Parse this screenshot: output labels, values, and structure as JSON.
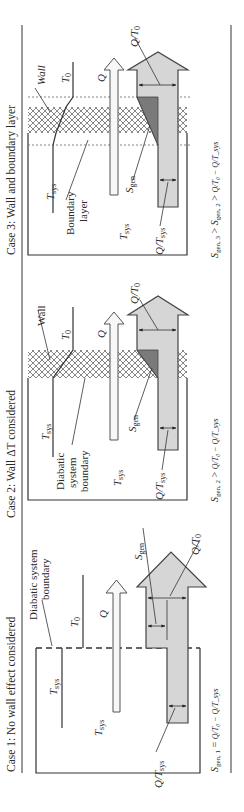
{
  "figure": {
    "orientation": "rotated-90-ccw",
    "colors": {
      "line": "#333333",
      "heat_arrow_fill": "#f7f7f7",
      "entropy_arrow_fill": "#d6d6d6",
      "sgen_fill": "#7a7a7a",
      "hatch": "#555555"
    },
    "cases": [
      {
        "id": "case1",
        "title": "Case 1: No wall effect considered",
        "labels": {
          "boundary": [
            "Diabatic system",
            "boundary"
          ],
          "t0": "T",
          "t0_sub": "0",
          "tsys_line": "T",
          "tsys_line_sub": "sys",
          "tsys_region": "T",
          "tsys_region_sub": "sys",
          "q": "Q",
          "sgen": "S",
          "sgen_sub": "gen",
          "q_t0": "Q/T",
          "q_t0_sub": "0",
          "q_tsys": "Q/T",
          "q_tsys_sub": "sys"
        },
        "formula": {
          "lhs": "S",
          "lhs_sub": "gen, 1",
          "rel": " = ",
          "rhs": "Q/T₀ − Q/T_sys"
        }
      },
      {
        "id": "case2",
        "title": "Case 2: Wall ΔT considered",
        "labels": {
          "wall": "Wall",
          "boundary": [
            "Diabatic",
            "system",
            "boundary"
          ],
          "t0": "T",
          "t0_sub": "0",
          "tsys_line": "T",
          "tsys_line_sub": "sys",
          "tsys_region": "T",
          "tsys_region_sub": "sys",
          "q": "Q",
          "sgen": "S",
          "sgen_sub": "gen",
          "q_t0": "Q/T",
          "q_t0_sub": "0",
          "q_tsys": "Q/T",
          "q_tsys_sub": "sys"
        },
        "formula": {
          "lhs": "S",
          "lhs_sub": "gen, 2",
          "rel": " > ",
          "rhs": "Q/T₀ − Q/T_sys"
        }
      },
      {
        "id": "case3",
        "title": "Case 3: Wall and boundary layer",
        "labels": {
          "wall": "Wall",
          "boundary_layer": [
            "Boundary",
            "layer"
          ],
          "t0": "T",
          "t0_sub": "0",
          "tsys_line": "T",
          "tsys_line_sub": "sys",
          "tsys_region": "T",
          "tsys_region_sub": "sys",
          "q": "Q",
          "sgen": "S",
          "sgen_sub": "gen",
          "q_t0": "Q/T",
          "q_t0_sub": "0",
          "q_tsys": "Q/T",
          "q_tsys_sub": "sys"
        },
        "formula": {
          "lhs": "S",
          "lhs_sub": "gen, 3",
          "rel": " > ",
          "mid": "S",
          "mid_sub": "gen, 2",
          "rel2": " > ",
          "rhs": "Q/T₀ − Q/T_sys"
        }
      }
    ]
  }
}
